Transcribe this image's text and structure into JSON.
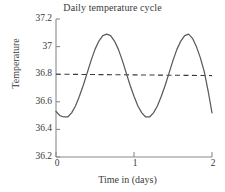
{
  "chart_data": {
    "type": "line",
    "title": "Daily temperature cycle",
    "xlabel": "Time in (days)",
    "ylabel": "Temperature",
    "xlim": [
      0,
      2
    ],
    "ylim": [
      36.2,
      37.2
    ],
    "grid": false,
    "legend": false,
    "x_ticks": [
      "0",
      "1",
      "2"
    ],
    "x_tick_values": [
      0,
      1,
      2
    ],
    "y_ticks": [
      "36.2",
      "36.4",
      "36.6",
      "36.8",
      "37",
      "37.2"
    ],
    "y_tick_values": [
      36.2,
      36.4,
      36.6,
      36.8,
      37,
      37.2
    ],
    "series": [
      {
        "name": "Body temperature",
        "style": "solid",
        "color": "#5a5a5a",
        "description": "Sinusoidal cycle, period 1 day, mean 36.79, amplitude 0.30, minimum near t=0.12 and t=1.12, maximum near t=0.62 and t=1.62",
        "x": [
          0.0,
          0.05,
          0.1,
          0.15,
          0.2,
          0.25,
          0.3,
          0.35,
          0.4,
          0.45,
          0.5,
          0.55,
          0.6,
          0.65,
          0.7,
          0.75,
          0.8,
          0.85,
          0.9,
          0.95,
          1.0,
          1.05,
          1.1,
          1.15,
          1.2,
          1.25,
          1.3,
          1.35,
          1.4,
          1.45,
          1.5,
          1.55,
          1.6,
          1.65,
          1.7,
          1.75,
          1.8,
          1.85,
          1.9,
          1.95,
          2.0
        ],
        "y": [
          36.53,
          36.5,
          36.49,
          36.49,
          36.52,
          36.57,
          36.64,
          36.72,
          36.81,
          36.9,
          36.98,
          37.04,
          37.08,
          37.09,
          37.08,
          37.04,
          36.98,
          36.9,
          36.81,
          36.72,
          36.64,
          36.57,
          36.52,
          36.49,
          36.49,
          36.52,
          36.57,
          36.64,
          36.72,
          36.81,
          36.9,
          36.98,
          37.04,
          37.08,
          37.09,
          37.06,
          37.0,
          36.92,
          36.82,
          36.68,
          36.52
        ]
      },
      {
        "name": "Mean reference line",
        "style": "dashed",
        "color": "#3a3a3a",
        "description": "Nearly horizontal dashed reference line at 36.80, sloping imperceptibly down to 36.79 at t=2",
        "x": [
          0,
          2
        ],
        "y": [
          36.8,
          36.79
        ]
      }
    ]
  },
  "axes": {
    "axis_color": "#8a8a8a",
    "tick_color": "#8a8a8a"
  }
}
